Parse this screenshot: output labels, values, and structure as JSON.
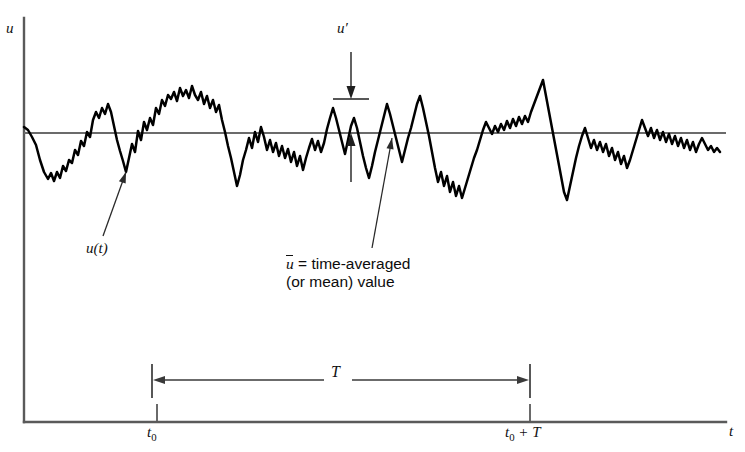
{
  "figure": {
    "axes": {
      "y_label": "u",
      "x_label": "t",
      "origin_x": 24,
      "origin_y": 422,
      "y_axis_top": 18,
      "x_axis_right": 726
    },
    "ticks": [
      {
        "name": "t0",
        "label_main": "t",
        "label_sub": "0",
        "x": 157
      },
      {
        "name": "t0-plus-T",
        "label_main": "t",
        "label_sub": "0",
        "label_tail": " + T",
        "x": 530
      }
    ],
    "mean_line": {
      "y": 133,
      "x_start": 24,
      "x_end": 726
    },
    "annotations": {
      "u_prime": {
        "label": "u′",
        "x": 351,
        "peak_y": 99,
        "base_y": 133,
        "arrow_top_y": 52,
        "tail_bottom_y": 182
      },
      "u_of_t": {
        "label": "u(t)",
        "text_x": 86,
        "text_y": 240,
        "leader_from_x": 103,
        "leader_from_y": 236,
        "leader_to_x": 126,
        "leader_to_y": 172
      },
      "mean_value": {
        "symbol": "u",
        "line1_rest": " = time-averaged",
        "line2": "(or mean) value",
        "text_x": 286,
        "text_y": 255,
        "leader_from_x": 372,
        "leader_from_y": 248,
        "leader_to_x": 392,
        "leader_to_y": 138
      },
      "T_span": {
        "label": "T",
        "y": 380,
        "x_left": 152,
        "x_right": 530,
        "cap_top": 364,
        "cap_bottom": 398,
        "gap_left": 324,
        "gap_right": 352
      }
    },
    "colors": {
      "signal": "#000000",
      "axis": "#5a5a5a",
      "mean_line": "#6b6b6b",
      "annotation_line": "#3a3a3a",
      "text": "#111111",
      "background": "#ffffff"
    },
    "signal": {
      "description": "turbulent velocity fluctuation trace u(t)",
      "baseline_y": 133,
      "points": [
        [
          24,
          127
        ],
        [
          28,
          130
        ],
        [
          32,
          137
        ],
        [
          36,
          145
        ],
        [
          40,
          160
        ],
        [
          44,
          172
        ],
        [
          48,
          179
        ],
        [
          51,
          173
        ],
        [
          54,
          181
        ],
        [
          57,
          172
        ],
        [
          60,
          178
        ],
        [
          63,
          166
        ],
        [
          66,
          171
        ],
        [
          69,
          160
        ],
        [
          72,
          163
        ],
        [
          75,
          150
        ],
        [
          78,
          155
        ],
        [
          81,
          141
        ],
        [
          84,
          146
        ],
        [
          87,
          132
        ],
        [
          90,
          137
        ],
        [
          93,
          120
        ],
        [
          96,
          112
        ],
        [
          99,
          118
        ],
        [
          102,
          108
        ],
        [
          105,
          114
        ],
        [
          108,
          104
        ],
        [
          111,
          112
        ],
        [
          114,
          126
        ],
        [
          117,
          140
        ],
        [
          120,
          151
        ],
        [
          123,
          161
        ],
        [
          126,
          172
        ],
        [
          129,
          158
        ],
        [
          132,
          144
        ],
        [
          135,
          152
        ],
        [
          138,
          131
        ],
        [
          141,
          140
        ],
        [
          144,
          122
        ],
        [
          147,
          130
        ],
        [
          150,
          118
        ],
        [
          153,
          125
        ],
        [
          156,
          108
        ],
        [
          159,
          114
        ],
        [
          162,
          100
        ],
        [
          165,
          106
        ],
        [
          168,
          95
        ],
        [
          171,
          99
        ],
        [
          174,
          92
        ],
        [
          177,
          101
        ],
        [
          180,
          88
        ],
        [
          183,
          96
        ],
        [
          186,
          90
        ],
        [
          189,
          98
        ],
        [
          192,
          86
        ],
        [
          195,
          95
        ],
        [
          198,
          100
        ],
        [
          201,
          92
        ],
        [
          204,
          104
        ],
        [
          207,
          96
        ],
        [
          210,
          108
        ],
        [
          213,
          100
        ],
        [
          216,
          112
        ],
        [
          219,
          105
        ],
        [
          222,
          120
        ],
        [
          225,
          132
        ],
        [
          228,
          146
        ],
        [
          231,
          158
        ],
        [
          234,
          172
        ],
        [
          237,
          186
        ],
        [
          240,
          175
        ],
        [
          243,
          160
        ],
        [
          246,
          150
        ],
        [
          249,
          138
        ],
        [
          252,
          148
        ],
        [
          255,
          132
        ],
        [
          258,
          142
        ],
        [
          261,
          127
        ],
        [
          264,
          137
        ],
        [
          267,
          150
        ],
        [
          270,
          140
        ],
        [
          273,
          152
        ],
        [
          276,
          143
        ],
        [
          279,
          156
        ],
        [
          282,
          146
        ],
        [
          285,
          158
        ],
        [
          288,
          149
        ],
        [
          291,
          162
        ],
        [
          294,
          152
        ],
        [
          297,
          166
        ],
        [
          300,
          156
        ],
        [
          303,
          170
        ],
        [
          306,
          158
        ],
        [
          309,
          148
        ],
        [
          312,
          139
        ],
        [
          315,
          150
        ],
        [
          318,
          141
        ],
        [
          321,
          152
        ],
        [
          324,
          143
        ],
        [
          327,
          129
        ],
        [
          330,
          118
        ],
        [
          333,
          108
        ],
        [
          336,
          118
        ],
        [
          339,
          130
        ],
        [
          342,
          142
        ],
        [
          345,
          154
        ],
        [
          348,
          140
        ],
        [
          351,
          126
        ],
        [
          354,
          118
        ],
        [
          357,
          128
        ],
        [
          360,
          142
        ],
        [
          363,
          156
        ],
        [
          366,
          168
        ],
        [
          369,
          178
        ],
        [
          372,
          166
        ],
        [
          375,
          152
        ],
        [
          378,
          140
        ],
        [
          381,
          128
        ],
        [
          384,
          116
        ],
        [
          387,
          104
        ],
        [
          390,
          114
        ],
        [
          393,
          126
        ],
        [
          396,
          138
        ],
        [
          399,
          150
        ],
        [
          402,
          162
        ],
        [
          405,
          150
        ],
        [
          408,
          138
        ],
        [
          411,
          128
        ],
        [
          414,
          116
        ],
        [
          417,
          104
        ],
        [
          420,
          96
        ],
        [
          423,
          108
        ],
        [
          426,
          122
        ],
        [
          429,
          136
        ],
        [
          432,
          152
        ],
        [
          435,
          168
        ],
        [
          438,
          182
        ],
        [
          441,
          172
        ],
        [
          444,
          186
        ],
        [
          447,
          176
        ],
        [
          450,
          192
        ],
        [
          453,
          182
        ],
        [
          456,
          196
        ],
        [
          459,
          186
        ],
        [
          462,
          198
        ],
        [
          465,
          188
        ],
        [
          468,
          178
        ],
        [
          471,
          168
        ],
        [
          474,
          158
        ],
        [
          477,
          150
        ],
        [
          480,
          140
        ],
        [
          483,
          130
        ],
        [
          486,
          122
        ],
        [
          489,
          128
        ],
        [
          492,
          134
        ],
        [
          495,
          126
        ],
        [
          498,
          132
        ],
        [
          501,
          124
        ],
        [
          504,
          130
        ],
        [
          507,
          121
        ],
        [
          510,
          128
        ],
        [
          513,
          119
        ],
        [
          516,
          126
        ],
        [
          519,
          117
        ],
        [
          522,
          124
        ],
        [
          525,
          116
        ],
        [
          528,
          122
        ],
        [
          531,
          112
        ],
        [
          534,
          104
        ],
        [
          537,
          96
        ],
        [
          540,
          88
        ],
        [
          543,
          80
        ],
        [
          546,
          96
        ],
        [
          549,
          112
        ],
        [
          552,
          128
        ],
        [
          555,
          144
        ],
        [
          558,
          160
        ],
        [
          561,
          176
        ],
        [
          564,
          192
        ],
        [
          567,
          200
        ],
        [
          570,
          186
        ],
        [
          573,
          172
        ],
        [
          576,
          158
        ],
        [
          579,
          146
        ],
        [
          582,
          136
        ],
        [
          585,
          128
        ],
        [
          588,
          138
        ],
        [
          591,
          148
        ],
        [
          594,
          140
        ],
        [
          597,
          150
        ],
        [
          600,
          142
        ],
        [
          603,
          152
        ],
        [
          606,
          144
        ],
        [
          609,
          156
        ],
        [
          612,
          148
        ],
        [
          615,
          160
        ],
        [
          618,
          152
        ],
        [
          621,
          164
        ],
        [
          624,
          156
        ],
        [
          627,
          168
        ],
        [
          630,
          160
        ],
        [
          633,
          150
        ],
        [
          636,
          140
        ],
        [
          639,
          130
        ],
        [
          642,
          120
        ],
        [
          645,
          128
        ],
        [
          648,
          136
        ],
        [
          651,
          128
        ],
        [
          654,
          138
        ],
        [
          657,
          130
        ],
        [
          660,
          140
        ],
        [
          663,
          132
        ],
        [
          666,
          142
        ],
        [
          669,
          134
        ],
        [
          672,
          144
        ],
        [
          675,
          136
        ],
        [
          678,
          146
        ],
        [
          681,
          138
        ],
        [
          684,
          148
        ],
        [
          687,
          140
        ],
        [
          690,
          150
        ],
        [
          693,
          142
        ],
        [
          696,
          152
        ],
        [
          699,
          144
        ],
        [
          702,
          138
        ],
        [
          705,
          144
        ],
        [
          708,
          150
        ],
        [
          711,
          146
        ],
        [
          714,
          152
        ],
        [
          717,
          148
        ],
        [
          720,
          152
        ]
      ]
    }
  }
}
